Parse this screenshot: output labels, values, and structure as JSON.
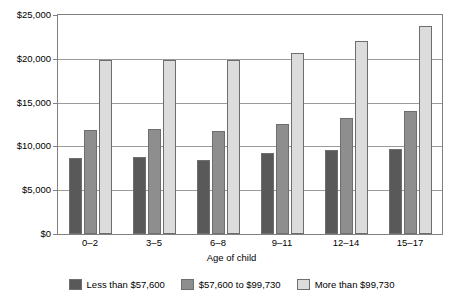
{
  "chart_data": {
    "type": "bar",
    "title": "",
    "subtitle": "",
    "xlabel": "Age of child",
    "ylabel": "",
    "categories": [
      "0–2",
      "3–5",
      "6–8",
      "9–11",
      "12–14",
      "15–17"
    ],
    "series": [
      {
        "name": "Less than $57,600",
        "color": "#595959",
        "values": [
          8700,
          8800,
          8400,
          9200,
          9600,
          9700
        ]
      },
      {
        "name": "$57,600 to $99,730",
        "color": "#8e8e8e",
        "values": [
          11900,
          12000,
          11800,
          12600,
          13300,
          14000
        ]
      },
      {
        "name": "More than $99,730",
        "color": "#dcdcdc",
        "values": [
          19900,
          19900,
          19900,
          20700,
          22000,
          23700
        ]
      }
    ],
    "ylim": [
      0,
      25000
    ],
    "yticks": [
      0,
      5000,
      10000,
      15000,
      20000,
      25000
    ],
    "ytick_labels": [
      "$0",
      "$5,000",
      "$10,000",
      "$15,000",
      "$20,000",
      "$25,000"
    ],
    "grid": true,
    "legend_position": "bottom"
  },
  "axes": {
    "x_title": "Age of child"
  }
}
